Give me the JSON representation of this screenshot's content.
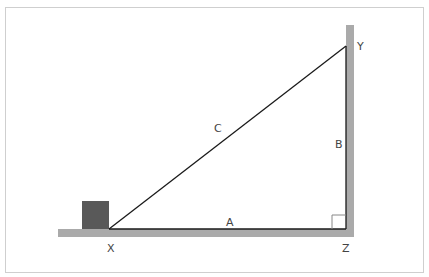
{
  "diagram": {
    "type": "right-triangle-ramp",
    "labels": {
      "hypotenuse": "C",
      "base": "A",
      "height": "B",
      "vertex_left": "X",
      "vertex_top": "Y",
      "vertex_right": "Z"
    },
    "colors": {
      "ground": "#aaaaaa",
      "wall": "#aaaaaa",
      "block": "#595959",
      "line": "#1a1a1a",
      "frame": "#cfcfcf"
    },
    "right_angle_marker": true
  }
}
